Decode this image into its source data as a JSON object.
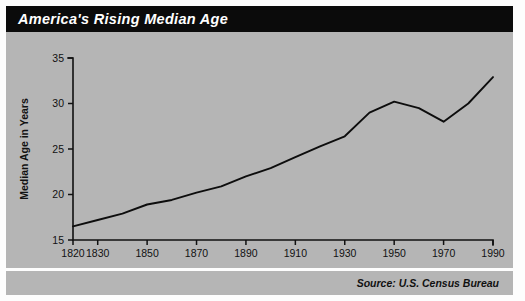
{
  "title": "America's Rising Median Age",
  "source": "Source: U.S. Census Bureau",
  "colors": {
    "banner_background": "#0b0b0b",
    "banner_text": "#ffffff",
    "panel_background": "#b5b5b5",
    "line": "#0d0d0d",
    "axis": "#111111",
    "page_background": "#fdfdfd"
  },
  "chart_data": {
    "type": "line",
    "title": "America's Rising Median Age",
    "xlabel": "",
    "ylabel": "Median Age in Years",
    "xlim": [
      1820,
      1990
    ],
    "ylim": [
      15,
      35
    ],
    "grid": false,
    "legend": "none",
    "x_tick_labels": [
      "1820",
      "1830",
      "1850",
      "1870",
      "1890",
      "1910",
      "1930",
      "1950",
      "1970",
      "1990"
    ],
    "x_ticks": [
      1820,
      1830,
      1850,
      1870,
      1890,
      1910,
      1930,
      1950,
      1970,
      1990
    ],
    "y_tick_labels": [
      "15",
      "20",
      "25",
      "30",
      "35"
    ],
    "y_ticks": [
      15,
      20,
      25,
      30,
      35
    ],
    "series": [
      {
        "name": "Median Age",
        "x": [
          1820,
          1830,
          1840,
          1850,
          1860,
          1870,
          1880,
          1890,
          1900,
          1910,
          1920,
          1930,
          1940,
          1950,
          1960,
          1970,
          1980,
          1990
        ],
        "values": [
          16.5,
          17.2,
          17.9,
          18.9,
          19.4,
          20.2,
          20.9,
          22.0,
          22.9,
          24.1,
          25.3,
          26.4,
          29.0,
          30.2,
          29.5,
          28.0,
          30.0,
          32.9
        ]
      }
    ]
  }
}
